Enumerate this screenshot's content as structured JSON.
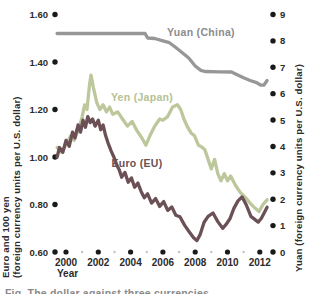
{
  "caption_fragment": "Fig. The dollar against three currencies",
  "chart_data": {
    "type": "line",
    "title": "",
    "xlabel": "Year",
    "grid": false,
    "legend_position": "inline-labels",
    "x_axis": {
      "label": "Year",
      "range": [
        1999.4,
        2012.5
      ],
      "major_ticks": [
        2000,
        2002,
        2004,
        2006,
        2008,
        2010,
        2012
      ],
      "minor_ticks": [
        2001,
        2003,
        2005,
        2007,
        2009,
        2011
      ]
    },
    "left_axis": {
      "title_line1": "Euro and 100 yen",
      "title_line2": "(foreign currency units per U.S. dollar)",
      "range": [
        0.6,
        1.6
      ],
      "ticks": [
        {
          "label": "1.60",
          "value": 1.6
        },
        {
          "label": "1.40",
          "value": 1.4
        },
        {
          "label": "1.20",
          "value": 1.2
        },
        {
          "label": "1.00",
          "value": 1.0
        },
        {
          "label": "0.80",
          "value": 0.8
        },
        {
          "label": "0.60",
          "value": 0.6
        }
      ]
    },
    "right_axis": {
      "title": "Yuan (foreign currency units per U.S. dollar)",
      "range": [
        0,
        9
      ],
      "ticks": [
        {
          "label": "9",
          "value": 9
        },
        {
          "label": "8",
          "value": 8
        },
        {
          "label": "7",
          "value": 7
        },
        {
          "label": "6",
          "value": 6
        },
        {
          "label": "5",
          "value": 5
        },
        {
          "label": "4",
          "value": 4
        },
        {
          "label": "3",
          "value": 3
        },
        {
          "label": "2",
          "value": 2
        },
        {
          "label": "1",
          "value": 1
        },
        {
          "label": "0",
          "value": 0
        }
      ]
    },
    "series": [
      {
        "name": "Yuan (China)",
        "axis": "right",
        "color": "#979797",
        "label_color": "#8c8c8c",
        "points": [
          [
            1999.45,
            8.28
          ],
          [
            2001,
            8.28
          ],
          [
            2003,
            8.28
          ],
          [
            2004.9,
            8.28
          ],
          [
            2005.05,
            8.11
          ],
          [
            2005.5,
            8.09
          ],
          [
            2006,
            8.0
          ],
          [
            2006.4,
            7.93
          ],
          [
            2006.8,
            7.75
          ],
          [
            2007.2,
            7.55
          ],
          [
            2007.6,
            7.35
          ],
          [
            2008.0,
            7.05
          ],
          [
            2008.35,
            6.88
          ],
          [
            2008.6,
            6.84
          ],
          [
            2009.5,
            6.83
          ],
          [
            2010.25,
            6.82
          ],
          [
            2010.6,
            6.72
          ],
          [
            2011.0,
            6.6
          ],
          [
            2011.4,
            6.5
          ],
          [
            2011.8,
            6.42
          ],
          [
            2012.05,
            6.33
          ],
          [
            2012.25,
            6.32
          ],
          [
            2012.45,
            6.5
          ]
        ]
      },
      {
        "name": "Yen (Japan)",
        "axis": "left",
        "color": "#bdc79c",
        "label_color": "#b5c293",
        "points": [
          [
            1999.45,
            1.04
          ],
          [
            1999.7,
            1.02
          ],
          [
            2000.0,
            1.05
          ],
          [
            2000.3,
            1.09
          ],
          [
            2000.5,
            1.07
          ],
          [
            2000.8,
            1.12
          ],
          [
            2001.0,
            1.17
          ],
          [
            2001.15,
            1.22
          ],
          [
            2001.3,
            1.2
          ],
          [
            2001.45,
            1.3
          ],
          [
            2001.55,
            1.345
          ],
          [
            2001.7,
            1.29
          ],
          [
            2001.9,
            1.23
          ],
          [
            2002.1,
            1.2
          ],
          [
            2002.3,
            1.22
          ],
          [
            2002.5,
            1.19
          ],
          [
            2002.7,
            1.21
          ],
          [
            2002.9,
            1.18
          ],
          [
            2003.2,
            1.19
          ],
          [
            2003.5,
            1.16
          ],
          [
            2003.8,
            1.13
          ],
          [
            2004.1,
            1.15
          ],
          [
            2004.4,
            1.11
          ],
          [
            2004.7,
            1.08
          ],
          [
            2004.95,
            1.05
          ],
          [
            2005.2,
            1.09
          ],
          [
            2005.5,
            1.13
          ],
          [
            2005.8,
            1.16
          ],
          [
            2006.0,
            1.155
          ],
          [
            2006.3,
            1.17
          ],
          [
            2006.6,
            1.21
          ],
          [
            2006.9,
            1.22
          ],
          [
            2007.1,
            1.2
          ],
          [
            2007.3,
            1.16
          ],
          [
            2007.5,
            1.13
          ],
          [
            2007.75,
            1.1
          ],
          [
            2007.95,
            1.09
          ],
          [
            2008.2,
            1.05
          ],
          [
            2008.45,
            1.04
          ],
          [
            2008.6,
            1.03
          ],
          [
            2008.8,
            0.99
          ],
          [
            2009.0,
            0.95
          ],
          [
            2009.2,
            0.99
          ],
          [
            2009.4,
            0.93
          ],
          [
            2009.6,
            0.9
          ],
          [
            2009.8,
            0.93
          ],
          [
            2010.0,
            0.9
          ],
          [
            2010.2,
            0.92
          ],
          [
            2010.5,
            0.88
          ],
          [
            2010.8,
            0.85
          ],
          [
            2011.1,
            0.83
          ],
          [
            2011.4,
            0.806
          ],
          [
            2011.7,
            0.785
          ],
          [
            2011.95,
            0.77
          ],
          [
            2012.2,
            0.8
          ],
          [
            2012.45,
            0.82
          ]
        ]
      },
      {
        "name": "Euro (EU)",
        "axis": "left",
        "color": "#6b5055",
        "label_color": "#6b5055",
        "points": [
          [
            1999.45,
            1.0
          ],
          [
            1999.6,
            1.04
          ],
          [
            1999.8,
            1.02
          ],
          [
            2000.0,
            1.07
          ],
          [
            2000.2,
            1.045
          ],
          [
            2000.4,
            1.105
          ],
          [
            2000.55,
            1.08
          ],
          [
            2000.75,
            1.135
          ],
          [
            2000.9,
            1.105
          ],
          [
            2001.05,
            1.155
          ],
          [
            2001.2,
            1.125
          ],
          [
            2001.35,
            1.17
          ],
          [
            2001.5,
            1.145
          ],
          [
            2001.65,
            1.16
          ],
          [
            2001.8,
            1.13
          ],
          [
            2002.0,
            1.155
          ],
          [
            2002.15,
            1.115
          ],
          [
            2002.3,
            1.135
          ],
          [
            2002.45,
            1.09
          ],
          [
            2002.6,
            1.06
          ],
          [
            2002.8,
            1.025
          ],
          [
            2003.0,
            0.995
          ],
          [
            2003.15,
            0.965
          ],
          [
            2003.3,
            0.945
          ],
          [
            2003.45,
            0.915
          ],
          [
            2003.65,
            0.935
          ],
          [
            2003.85,
            0.894
          ],
          [
            2004.05,
            0.912
          ],
          [
            2004.25,
            0.873
          ],
          [
            2004.45,
            0.89
          ],
          [
            2004.65,
            0.855
          ],
          [
            2004.85,
            0.828
          ],
          [
            2005.05,
            0.845
          ],
          [
            2005.3,
            0.806
          ],
          [
            2005.55,
            0.825
          ],
          [
            2005.8,
            0.792
          ],
          [
            2006.05,
            0.812
          ],
          [
            2006.3,
            0.775
          ],
          [
            2006.55,
            0.79
          ],
          [
            2006.8,
            0.755
          ],
          [
            2007.05,
            0.748
          ],
          [
            2007.35,
            0.712
          ],
          [
            2007.65,
            0.683
          ],
          [
            2007.9,
            0.66
          ],
          [
            2008.1,
            0.648
          ],
          [
            2008.3,
            0.672
          ],
          [
            2008.55,
            0.725
          ],
          [
            2008.8,
            0.75
          ],
          [
            2009.1,
            0.764
          ],
          [
            2009.4,
            0.728
          ],
          [
            2009.7,
            0.7
          ],
          [
            2009.9,
            0.715
          ],
          [
            2010.15,
            0.74
          ],
          [
            2010.4,
            0.785
          ],
          [
            2010.65,
            0.815
          ],
          [
            2010.9,
            0.832
          ],
          [
            2011.15,
            0.8
          ],
          [
            2011.45,
            0.75
          ],
          [
            2011.9,
            0.726
          ],
          [
            2012.1,
            0.742
          ],
          [
            2012.45,
            0.788
          ]
        ]
      }
    ]
  }
}
